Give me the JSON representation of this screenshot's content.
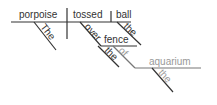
{
  "diagram": {
    "type": "sentence-diagram",
    "words": {
      "subject": "porpoise",
      "verb": "tossed",
      "object": "ball",
      "subject_article": "The",
      "object_article": "the",
      "preposition1": "over",
      "prep1_object": "fence",
      "prep1_article": "the",
      "preposition2": "of",
      "prep2_object": "aquarium",
      "prep2_article": "the"
    },
    "colors": {
      "ink": "#333333",
      "faded": "#999999"
    }
  }
}
